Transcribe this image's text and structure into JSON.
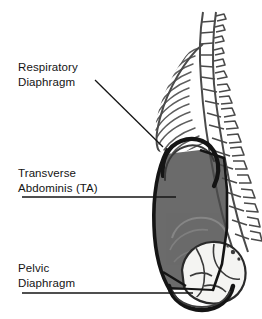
{
  "figure": {
    "background_color": "#ffffff",
    "line_color": "#141414",
    "ta_fill_color": "#6b6b6b",
    "bone_fill_color": "#f2f2f0",
    "rib_stroke_color": "#5e5e5e",
    "spine_stroke_color": "#4a4a4a"
  },
  "labels": {
    "respiratory": {
      "name": "respiratory-diaphragm-label",
      "line1": "Respiratory",
      "line2": "Diaphragm"
    },
    "transverse": {
      "name": "transverse-abdominis-label",
      "line1": "Transverse",
      "line2": "Abdominis (TA)"
    },
    "pelvic": {
      "name": "pelvic-diaphragm-label",
      "line1": "Pelvic",
      "line2": "Diaphragm"
    }
  },
  "leaders": {
    "respiratory": {
      "type": "diagonal",
      "x1": 95,
      "y1": 80,
      "x2": 163,
      "y2": 147
    },
    "transverse": {
      "type": "horizontal",
      "x1": 22,
      "y1": 197,
      "x2": 176,
      "y2": 197
    },
    "pelvic": {
      "type": "horizontal",
      "x1": 22,
      "y1": 293,
      "x2": 193,
      "y2": 293
    }
  },
  "structures": [
    {
      "name": "spine",
      "description": "Stacked vertebrae with spinous processes running down the posterior right side"
    },
    {
      "name": "rib-cage",
      "description": "Hatched curving ribs forming the thorax"
    },
    {
      "name": "respiratory-diaphragm",
      "description": "Thick dark dome arc beneath the rib cage"
    },
    {
      "name": "transverse-abdominis",
      "description": "Gray shaded abdominal wall cylinder"
    },
    {
      "name": "pelvis",
      "description": "Light bony pelvis at the base"
    },
    {
      "name": "pelvic-diaphragm",
      "description": "Thick dark bowl arc closing the base of the cylinder"
    }
  ]
}
